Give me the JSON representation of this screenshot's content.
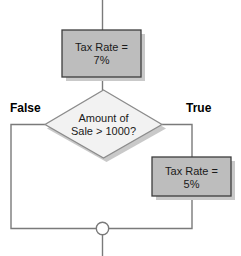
{
  "diagram": {
    "type": "flowchart",
    "colors": {
      "process_fill": "#bdbdbd",
      "process_border": "#3d3d3d",
      "decision_fill": "#f2f2f2",
      "decision_border": "#8c8c8c",
      "shadow": "#c9c9c9",
      "connector_line": "#7a7a7a",
      "text": "#1a1a1a",
      "label_text": "#000000",
      "background": "#ffffff"
    },
    "nodes": [
      {
        "id": "proc1",
        "shape": "process",
        "line1": "Tax Rate =",
        "line2": "7%"
      },
      {
        "id": "decision",
        "shape": "decision",
        "line1": "Amount of",
        "line2": "Sale > 1000?"
      },
      {
        "id": "proc2",
        "shape": "process",
        "line1": "Tax Rate =",
        "line2": "5%"
      },
      {
        "id": "merge",
        "shape": "connector",
        "label": ""
      }
    ],
    "branch_labels": {
      "false": "False",
      "true": "True"
    }
  }
}
